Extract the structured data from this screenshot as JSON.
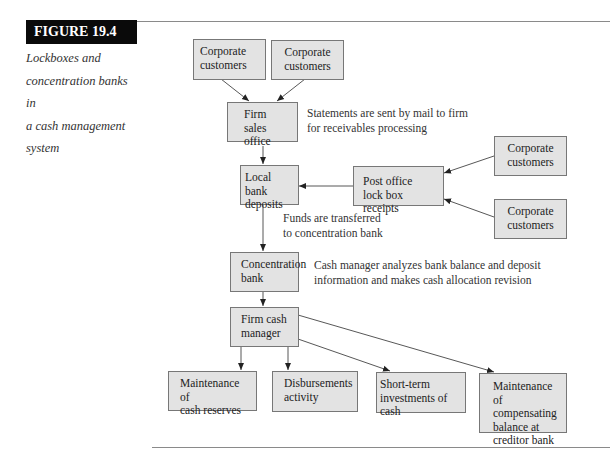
{
  "figure": {
    "label": "FIGURE 19.4",
    "caption": [
      "Lockboxes and",
      "concentration banks in",
      "a cash management",
      "system"
    ]
  },
  "nodes": {
    "corporate_customers_1": [
      "Corporate",
      "customers"
    ],
    "corporate_customers_2": [
      "Corporate",
      "customers"
    ],
    "firm_sales_office": [
      "Firm sales",
      "office"
    ],
    "local_bank_deposits": [
      "Local bank",
      "deposits"
    ],
    "post_office_lockbox": [
      "Post office",
      "lock box receipts"
    ],
    "corporate_customers_3": [
      "Corporate",
      "customers"
    ],
    "corporate_customers_4": [
      "Corporate",
      "customers"
    ],
    "concentration_bank": [
      "Concentration",
      "bank"
    ],
    "firm_cash_manager": [
      "Firm cash",
      "manager"
    ],
    "cash_reserves": [
      "Maintenance of",
      "cash reserves"
    ],
    "disbursements": [
      "Disbursements",
      "activity"
    ],
    "short_term_investments": [
      "Short-term",
      "investments of cash"
    ],
    "compensating_balance": [
      "Maintenance of",
      "compensating",
      "balance at",
      "creditor bank"
    ]
  },
  "annotations": {
    "statements": [
      "Statements are sent by mail to firm",
      "for receivables processing"
    ],
    "funds": [
      "Funds are transferred",
      "to concentration bank"
    ],
    "cash_manager": [
      "Cash manager analyzes bank balance and deposit",
      "information and makes cash allocation revision"
    ]
  },
  "colors": {
    "box_fill": "#e3e3e3",
    "box_border": "#777777",
    "label_bg": "#0a0a0a",
    "rule": "#8a8a8a"
  }
}
